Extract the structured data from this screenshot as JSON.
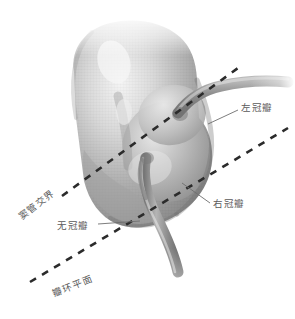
{
  "figure": {
    "style": "grayscale medical line-and-wash drawing on white background",
    "colors": {
      "background": "#ffffff",
      "label_text": "#5a5a5a",
      "dash_line": "#2b2b2b",
      "leader_line": "#6e6e6e",
      "tissue_dark": "#6b6b6b",
      "tissue_mid": "#9a9a9a",
      "tissue_light": "#d8d8d8",
      "tissue_highlight": "#f2f2f2"
    }
  },
  "labels": {
    "left_coronary_cusp": "左冠瓣",
    "right_coronary_cusp": "右冠瓣",
    "non_coronary_cusp": "无冠瓣",
    "sinotubular_junction": "窦管交界",
    "annulus_plane": "瓣环平面"
  },
  "structures": {
    "aortic_root": "aortic-root",
    "left_coronary_artery": "left-coronary-artery",
    "right_coronary_artery": "right-coronary-artery",
    "sinus_of_valsalva_left": "left-sinus",
    "sinus_of_valsalva_right": "right-sinus",
    "sinus_of_valsalva_non": "non-coronary-sinus"
  },
  "reference_planes": [
    {
      "name": "窦管交界",
      "style": "dashed",
      "angle_deg": -22
    },
    {
      "name": "瓣环平面",
      "style": "dashed",
      "angle_deg": -22
    }
  ]
}
